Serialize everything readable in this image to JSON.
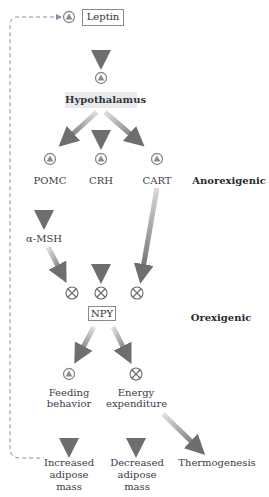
{
  "diagram": {
    "nodes": {
      "leptin": "Leptin",
      "hypothalamus": "Hypothalamus",
      "pomc": "POMC",
      "crh": "CRH",
      "cart": "CART",
      "amsh": "α-MSH",
      "npy": "NPY",
      "feeding": "Feeding behavior",
      "feeding_line1": "Feeding",
      "feeding_line2": "behavior",
      "energy_line1": "Energy",
      "energy_line2": "expenditure",
      "increased_line1": "Increased",
      "increased_line2": "adipose",
      "increased_line3": "mass",
      "decreased_line1": "Decreased",
      "decreased_line2": "adipose",
      "decreased_line3": "mass",
      "thermogenesis": "Thermogenesis"
    },
    "side_labels": {
      "anorexigenic": "Anorexigenic",
      "orexigenic": "Orexigenic"
    },
    "icons": {
      "stimulatory": "circled-triangle-icon (stimulation)",
      "inhibitory": "circled-x-icon (inhibition)"
    },
    "colors": {
      "arrow": "#7a7a7a",
      "hypothalamus_bg": "#e9e9f0",
      "text": "#3b3b48",
      "icon_fill": "#9a9a9a",
      "feedback_line": "#8080a0"
    }
  }
}
